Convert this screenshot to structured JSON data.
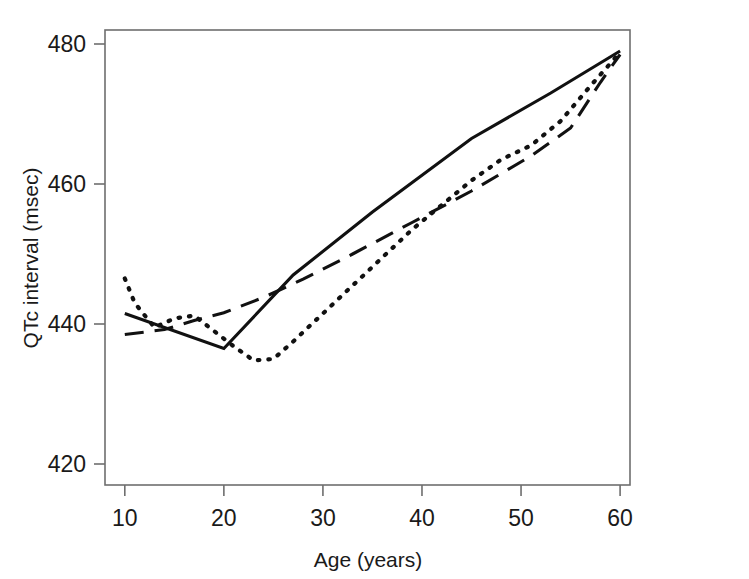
{
  "figure": {
    "partial_caption_above": "",
    "background_color": "#ffffff",
    "axis_color": "#6e6e6e",
    "line_color": "#111111"
  },
  "chart_data": {
    "type": "line",
    "title": "",
    "xlabel": "Age (years)",
    "ylabel": "QTc interval (msec)",
    "xlim": [
      8,
      61
    ],
    "ylim": [
      417,
      482
    ],
    "xticks": [
      10,
      20,
      30,
      40,
      50,
      60
    ],
    "xtick_labels": [
      "10",
      "20",
      "30",
      "40",
      "50",
      "60"
    ],
    "yticks": [
      420,
      440,
      460,
      480
    ],
    "ytick_labels": [
      "420",
      "440",
      "460",
      "480"
    ],
    "grid": false,
    "legend": "none",
    "series": [
      {
        "name": "solid",
        "style": "solid",
        "x": [
          10,
          20,
          27,
          35,
          45,
          53,
          60
        ],
        "y": [
          441.5,
          436.5,
          447.0,
          456.0,
          466.5,
          473.0,
          479.0
        ]
      },
      {
        "name": "dashed",
        "style": "dashed",
        "x": [
          10,
          14,
          17,
          20,
          24,
          28,
          33,
          39,
          45,
          51,
          55,
          58,
          60
        ],
        "y": [
          438.5,
          439.2,
          440.5,
          441.6,
          443.8,
          446.4,
          450.0,
          454.5,
          459.0,
          464.0,
          468.0,
          474.5,
          478.5
        ]
      },
      {
        "name": "dotted",
        "style": "dotted",
        "x": [
          10,
          11,
          13,
          15,
          17,
          19,
          21,
          23,
          25,
          27,
          30,
          33,
          36,
          39,
          42,
          45,
          48,
          51,
          54,
          57,
          60
        ],
        "y": [
          446.5,
          443.0,
          439.5,
          440.8,
          441.2,
          439.0,
          436.8,
          434.8,
          435.0,
          437.5,
          441.5,
          445.5,
          449.5,
          453.5,
          457.0,
          460.5,
          463.5,
          465.5,
          469.0,
          474.0,
          478.8
        ]
      }
    ]
  }
}
